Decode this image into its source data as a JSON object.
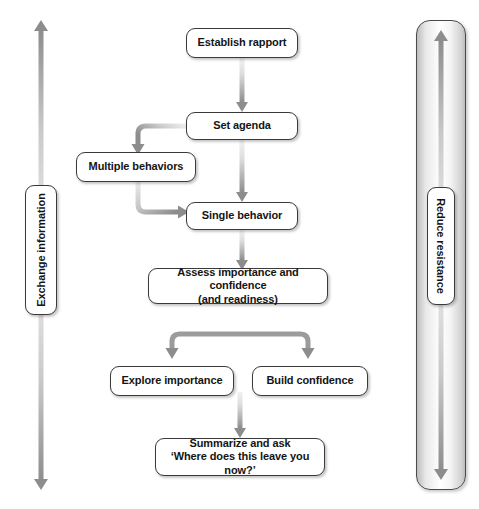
{
  "diagram": {
    "background_color": "#ffffff",
    "box_border_color": "#3a3a3a",
    "arrow_color": "#8d8d8d",
    "nodes": [
      {
        "id": "establish_rapport",
        "label": "Establish rapport"
      },
      {
        "id": "set_agenda",
        "label": "Set agenda"
      },
      {
        "id": "multiple_behaviors",
        "label": "Multiple behaviors"
      },
      {
        "id": "single_behavior",
        "label": "Single behavior"
      },
      {
        "id": "assess",
        "line1": "Assess importance and confidence",
        "line2": "(and readiness)"
      },
      {
        "id": "explore_importance",
        "label": "Explore importance"
      },
      {
        "id": "build_confidence",
        "label": "Build confidence"
      },
      {
        "id": "summarize",
        "line1": "Summarize and ask",
        "line2": "‘Where does this leave you now?’"
      }
    ],
    "side_rails": [
      {
        "id": "left_rail",
        "label": "Exchange information",
        "direction": "bidirectional",
        "position": "left"
      },
      {
        "id": "right_rail",
        "label": "Reduce resistance",
        "direction": "bidirectional",
        "position": "right"
      }
    ]
  }
}
